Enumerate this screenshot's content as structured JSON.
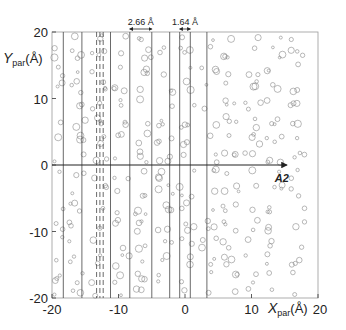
{
  "figure": {
    "title": "",
    "x_axis": {
      "label_main": "X",
      "label_sub": "par",
      "label_unit": "(Å)",
      "range": [
        -20,
        20
      ],
      "ticks": [
        {
          "value": -20,
          "label": "-20"
        },
        {
          "value": -10,
          "label": "-10"
        },
        {
          "value": 0,
          "label": "0"
        },
        {
          "value": 10,
          "label": "10"
        },
        {
          "value": 20,
          "label": "20"
        }
      ]
    },
    "y_axis": {
      "label_main": "Y",
      "label_sub": "par",
      "label_unit": "(Å)",
      "range": [
        -20,
        20
      ],
      "ticks": [
        {
          "value": 20,
          "label": "20"
        },
        {
          "value": 10,
          "label": "10"
        },
        {
          "value": 0,
          "label": "0"
        },
        {
          "value": -10,
          "label": "-10"
        },
        {
          "value": -20,
          "label": "-20"
        }
      ]
    },
    "annotations": [
      {
        "text": "2.66 Å",
        "x": -6.6,
        "y": 20.6,
        "span": [
          -8.3,
          -5.0
        ]
      },
      {
        "text": "1.64 Å",
        "x": 0.2,
        "y": 20.6,
        "span": [
          -0.8,
          0.8
        ]
      },
      {
        "text": "A2",
        "x": 13.5,
        "y": -1.2,
        "arrow_from": [
          -20,
          0
        ],
        "arrow_to": [
          15.3,
          0
        ]
      }
    ],
    "vertical_lines": [
      {
        "x": -18.3,
        "style": "solid"
      },
      {
        "x": -15.5,
        "style": "solid"
      },
      {
        "x": -13.3,
        "style": "dashed"
      },
      {
        "x": -12.8,
        "style": "dashed"
      },
      {
        "x": -12.3,
        "style": "dashed"
      },
      {
        "x": -11.2,
        "style": "solid"
      },
      {
        "x": -8.3,
        "style": "solid"
      },
      {
        "x": -5.0,
        "style": "solid"
      },
      {
        "x": -2.3,
        "style": "solid"
      },
      {
        "x": -0.8,
        "style": "solid"
      },
      {
        "x": 0.8,
        "style": "solid"
      },
      {
        "x": 3.3,
        "style": "solid"
      }
    ],
    "colors": {
      "axis": "#333333",
      "line": "#444444",
      "circle": "#8a8a8a",
      "text": "#222222"
    }
  }
}
